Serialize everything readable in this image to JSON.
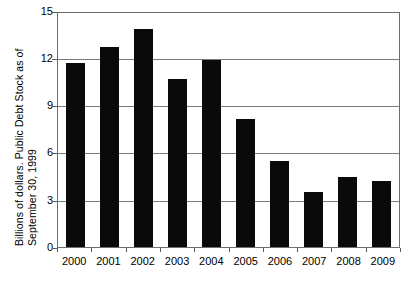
{
  "chart_data": {
    "type": "bar",
    "title": "",
    "xlabel": "",
    "ylabel": "Billions of dollars.  Public Debt Stock as of September 30, 1999",
    "ylabel_line1": "Billions of dollars.  Public Debt Stock as of",
    "ylabel_line2": "September 30, 1999",
    "categories": [
      "2000",
      "2001",
      "2002",
      "2003",
      "2004",
      "2005",
      "2006",
      "2007",
      "2008",
      "2009"
    ],
    "values": [
      11.8,
      12.8,
      14.0,
      10.8,
      12.0,
      8.2,
      5.5,
      3.5,
      4.5,
      4.2
    ],
    "ylim": [
      0,
      15
    ],
    "yticks": [
      "0",
      "3",
      "6",
      "9",
      "12",
      "15"
    ],
    "ytick_values": [
      0,
      3,
      6,
      9,
      12,
      15
    ],
    "grid": true,
    "grid_axis": "y",
    "legend": "none",
    "bar_color": "#0a0a0a",
    "frame_color": "#6e6e6e",
    "background": "#ffffff"
  },
  "caption": {
    "clipped_text": ""
  }
}
